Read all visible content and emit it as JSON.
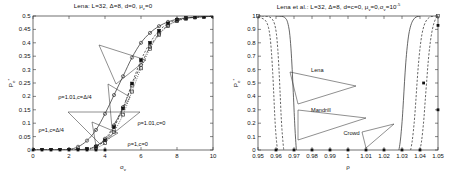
{
  "figure": {
    "background": "#ffffff",
    "line_color": "#333333",
    "marker_color": "#222222"
  },
  "chart_data": [
    {
      "id": "left",
      "type": "line",
      "title": "Lena: L=32, Δ=8, d=0, μ_v=0",
      "title_parts": {
        "name": "Lena:",
        "L": "L=32,",
        "delta": "Δ=8,",
        "d": "d=0,",
        "mu": "μ",
        "mu_sub": "v",
        "mu_val": "=0"
      },
      "xlabel": "σ",
      "xlabel_sub": "v",
      "ylabel": "P",
      "ylabel_sub": "e",
      "ylabel_sup": "*",
      "xlim": [
        0,
        10
      ],
      "ylim": [
        0,
        0.5
      ],
      "xticks": [
        0,
        2,
        4,
        6,
        8,
        10
      ],
      "xticklabels": [
        "0",
        "2",
        "4",
        "6",
        "8",
        "10"
      ],
      "yticks": [
        0,
        0.05,
        0.1,
        0.15,
        0.2,
        0.25,
        0.3,
        0.35,
        0.4,
        0.45,
        0.5
      ],
      "yticklabels": [
        "0",
        "0.05",
        "0.1",
        "0.15",
        "0.2",
        "0.25",
        "0.3",
        "0.35",
        "0.4",
        "0.45",
        "0.5"
      ],
      "grid": false,
      "legend_position": "annotations",
      "series": [
        {
          "name": "ρ=1.01,c=Δ/4",
          "label": "ρ=1.01,c=Δ/4",
          "style": "solid",
          "marker": "circle-open",
          "x": [
            0,
            0.5,
            1,
            1.5,
            2,
            2.5,
            3,
            3.5,
            4,
            4.5,
            5,
            5.5,
            6,
            6.5,
            7,
            7.5,
            8,
            8.5,
            9,
            9.5,
            10
          ],
          "y": [
            0,
            0,
            0,
            0,
            0.002,
            0.012,
            0.035,
            0.075,
            0.135,
            0.205,
            0.275,
            0.345,
            0.4,
            0.437,
            0.462,
            0.478,
            0.488,
            0.493,
            0.496,
            0.498,
            0.499
          ]
        },
        {
          "name": "ρ=1,c=Δ/4",
          "label": "ρ=1,c=Δ/4",
          "style": "dashdot",
          "marker": "circle-open",
          "x": [
            0,
            0.5,
            1,
            1.5,
            2,
            2.5,
            3,
            3.5,
            4,
            4.5,
            5,
            5.5,
            6,
            6.5,
            7,
            7.5,
            8,
            8.5,
            9,
            9.5,
            10
          ],
          "y": [
            0,
            0,
            0,
            0,
            0,
            0.001,
            0.004,
            0.015,
            0.042,
            0.092,
            0.16,
            0.24,
            0.318,
            0.385,
            0.434,
            0.465,
            0.482,
            0.491,
            0.495,
            0.497,
            0.499
          ]
        },
        {
          "name": "ρ=1.01,c=0",
          "label": "ρ=1.01,c=0",
          "style": "dashed",
          "marker": "square-filled",
          "x": [
            0,
            0.5,
            1,
            1.5,
            2,
            2.5,
            3,
            3.5,
            4,
            4.5,
            5,
            5.5,
            6,
            6.5,
            7,
            7.5,
            8,
            8.5,
            9,
            9.5,
            10
          ],
          "y": [
            0,
            0,
            0,
            0,
            0,
            0.001,
            0.004,
            0.012,
            0.036,
            0.085,
            0.155,
            0.248,
            0.335,
            0.4,
            0.445,
            0.472,
            0.486,
            0.492,
            0.496,
            0.498,
            0.499
          ]
        },
        {
          "name": "ρ=1,c=0",
          "label": "ρ=1,c=0",
          "style": "dotted",
          "marker": "square-open",
          "x": [
            0,
            0.5,
            1,
            1.5,
            2,
            2.5,
            3,
            3.5,
            4,
            4.5,
            5,
            5.5,
            6,
            6.5,
            7,
            7.5,
            8,
            8.5,
            9,
            9.5,
            10
          ],
          "y": [
            0,
            0,
            0,
            0,
            0,
            0,
            0.002,
            0.008,
            0.026,
            0.068,
            0.132,
            0.218,
            0.305,
            0.378,
            0.43,
            0.463,
            0.481,
            0.49,
            0.495,
            0.497,
            0.499
          ]
        }
      ],
      "annotations": [
        {
          "id": "a1",
          "text": "ρ=1.01,c=Δ/4",
          "x": 0.14,
          "y": 0.395
        },
        {
          "id": "a2",
          "text": "ρ=1,c=Δ/4",
          "x": 0.03,
          "y": 0.152
        },
        {
          "id": "a3",
          "text": "ρ=1.01,c=0",
          "x": 0.58,
          "y": 0.205
        },
        {
          "id": "a4",
          "text": "ρ=1,c=0",
          "x": 0.525,
          "y": 0.047
        }
      ]
    },
    {
      "id": "right",
      "type": "line",
      "title": "Lena et al.: L=32, Δ=8, d=c=0, μ_v=0,σ_v=10^-5",
      "title_parts": {
        "name": "Lena et al.:",
        "L": "L=32,",
        "delta": "Δ=8,",
        "dc": "d=c=0,",
        "mu": "μ",
        "mu_sub": "v",
        "mu_val": "=0,",
        "sigma": "σ",
        "sigma_sub": "v",
        "sigma_val": "=10",
        "sigma_exp": "-5"
      },
      "xlabel": "ρ",
      "ylabel": "P",
      "ylabel_sub": "e",
      "ylabel_sup": "*",
      "xlim": [
        0.95,
        1.05
      ],
      "ylim": [
        0,
        1
      ],
      "xticks": [
        0.95,
        0.96,
        0.97,
        0.98,
        0.99,
        1.0,
        1.01,
        1.02,
        1.03,
        1.04,
        1.05
      ],
      "xticklabels": [
        "0.95",
        "0.96",
        "0.97",
        "0.98",
        "0.99",
        "1",
        "1.01",
        "1.02",
        "1.03",
        "1.04",
        "1.05"
      ],
      "yticks": [
        0,
        0.1,
        0.2,
        0.3,
        0.4,
        0.5,
        0.6,
        0.7,
        0.8,
        0.9,
        1
      ],
      "yticklabels": [
        "0",
        "0.1",
        "0.2",
        "0.3",
        "0.4",
        "0.5",
        "0.6",
        "0.7",
        "0.8",
        "0.9",
        "1"
      ],
      "grid": false,
      "legend_position": "annotations",
      "series": [
        {
          "name": "Lena-left",
          "label": "Lena",
          "style": "solid",
          "marker": "none",
          "x": [
            0.96,
            0.962,
            0.964,
            0.9655,
            0.9665,
            0.9675,
            0.9683,
            0.969,
            0.9696,
            0.9701,
            0.9705,
            0.9709,
            0.9713
          ],
          "y": [
            1.0,
            0.999,
            0.995,
            0.98,
            0.95,
            0.88,
            0.76,
            0.6,
            0.43,
            0.28,
            0.17,
            0.08,
            0.0
          ]
        },
        {
          "name": "Mandrill-left",
          "label": "Mandrill",
          "style": "dashed",
          "marker": "none",
          "x": [
            0.952,
            0.9545,
            0.9565,
            0.958,
            0.9592,
            0.9602,
            0.961,
            0.9617,
            0.9623,
            0.9628,
            0.9633,
            0.9638,
            0.9643
          ],
          "y": [
            1.0,
            0.998,
            0.992,
            0.975,
            0.94,
            0.87,
            0.75,
            0.59,
            0.42,
            0.27,
            0.155,
            0.07,
            0.0
          ]
        },
        {
          "name": "Crowd-left",
          "label": "Crowd",
          "style": "dashed",
          "marker": "none",
          "x": [
            0.95,
            0.9518,
            0.9534,
            0.9547,
            0.9558,
            0.9567,
            0.9575,
            0.9582,
            0.9588,
            0.9593,
            0.9598,
            0.9603,
            0.9608
          ],
          "y": [
            0.99,
            0.985,
            0.975,
            0.955,
            0.915,
            0.845,
            0.725,
            0.57,
            0.405,
            0.258,
            0.145,
            0.065,
            0.0
          ]
        },
        {
          "name": "Lena-right",
          "label": "Lena",
          "style": "solid",
          "marker": "none",
          "x": [
            0.0,
            0.0,
            0.0,
            0.0,
            0.0,
            0.0,
            0.0,
            0.0,
            0.0,
            0.0,
            0.0,
            0.0,
            0.0
          ],
          "x_vals": [
            1.0283,
            1.029,
            1.0296,
            1.0302,
            1.0308,
            1.0314,
            1.0321,
            1.0329,
            1.0338,
            1.0349,
            1.0362,
            1.0378,
            1.04
          ],
          "y": [
            0.0,
            0.06,
            0.14,
            0.24,
            0.37,
            0.51,
            0.65,
            0.77,
            0.865,
            0.93,
            0.97,
            0.992,
            1.0
          ]
        },
        {
          "name": "Mandrill-right",
          "label": "Mandrill",
          "style": "dashed",
          "marker": "none",
          "x_vals": [
            1.0348,
            1.0356,
            1.0363,
            1.037,
            1.0377,
            1.0384,
            1.0392,
            1.0401,
            1.0411,
            1.0423,
            1.0437,
            1.0455,
            1.0478
          ],
          "y": [
            0.0,
            0.06,
            0.14,
            0.24,
            0.37,
            0.51,
            0.65,
            0.77,
            0.865,
            0.93,
            0.97,
            0.992,
            1.0
          ]
        },
        {
          "name": "Crowd-right",
          "label": "Crowd",
          "style": "dashed",
          "marker": "none",
          "x_vals": [
            1.04,
            1.0408,
            1.0415,
            1.0422,
            1.0429,
            1.0437,
            1.0445,
            1.0454,
            1.0464,
            1.0476,
            1.0489,
            1.0496,
            1.05
          ],
          "y": [
            0.0,
            0.06,
            0.14,
            0.24,
            0.37,
            0.51,
            0.65,
            0.77,
            0.865,
            0.94,
            0.985,
            0.996,
            1.0
          ]
        }
      ],
      "annotations": [
        {
          "id": "b1",
          "text": "Lena",
          "x": 0.295,
          "y": 0.595
        },
        {
          "id": "b2",
          "text": "Mandrill",
          "x": 0.295,
          "y": 0.3
        },
        {
          "id": "b3",
          "text": "Crowd",
          "x": 0.475,
          "y": 0.128
        }
      ]
    }
  ]
}
